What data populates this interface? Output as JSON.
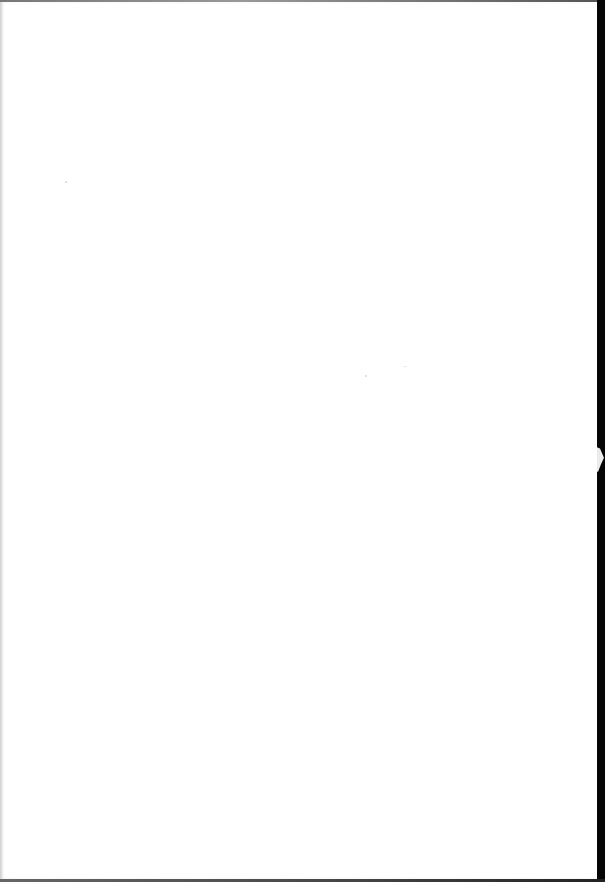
{
  "document": {
    "type": "scanned-page",
    "content": "",
    "colors": {
      "paper": "#ffffff",
      "scan_background": "#050505",
      "edge_shadow": "#cfcfcf"
    }
  }
}
